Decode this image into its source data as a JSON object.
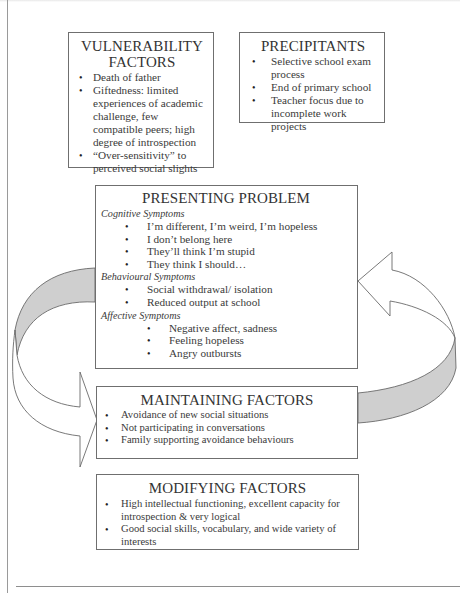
{
  "diagram": {
    "type": "case-formulation-flow",
    "colors": {
      "box_border": "#6f6f6f",
      "arrow_fill_back": "#cfcfcf",
      "arrow_fill_front": "#ffffff",
      "arrow_stroke": "#6a6a6a",
      "text": "#333333"
    },
    "vulnerability": {
      "title_line1": "VULNERABILITY",
      "title_line2": "FACTORS",
      "items": [
        "Death of father",
        "Giftedness: limited experiences of academic challenge, few compatible peers; high degree of introspection",
        "“Over-sensitivity” to perceived social slights"
      ]
    },
    "precipitants": {
      "title": "PRECIPITANTS",
      "items": [
        "Selective school exam process",
        "End of primary school",
        "Teacher focus due to incomplete work projects"
      ]
    },
    "presenting": {
      "title": "PRESENTING PROBLEM",
      "cognitive": {
        "heading": "Cognitive Symptoms",
        "items": [
          "I’m different, I’m weird, I’m hopeless",
          "I don’t belong here",
          "They’ll think I’m stupid",
          "They think I should…"
        ]
      },
      "behavioural": {
        "heading": "Behavioural Symptoms",
        "items": [
          "Social withdrawal/ isolation",
          "Reduced output at school"
        ]
      },
      "affective": {
        "heading": "Affective Symptoms",
        "items": [
          "Negative affect, sadness",
          "Feeling hopeless",
          "Angry outbursts"
        ]
      }
    },
    "maintaining": {
      "title": "MAINTAINING FACTORS",
      "items": [
        "Avoidance of new social situations",
        "Not participating in conversations",
        "Family supporting avoidance behaviours"
      ]
    },
    "modifying": {
      "title": "MODIFYING FACTORS",
      "items": [
        "High intellectual functioning, excellent capacity for introspection & very logical",
        "Good social skills, vocabulary, and wide variety of interests"
      ]
    },
    "arrows": [
      {
        "name": "left-curved-arrow",
        "from": "presenting",
        "to": "maintaining",
        "direction": "down-right"
      },
      {
        "name": "right-curved-arrow",
        "from": "maintaining",
        "to": "presenting",
        "direction": "up-left"
      }
    ]
  }
}
